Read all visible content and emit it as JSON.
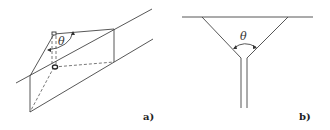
{
  "figure": {
    "panel_a": {
      "label": "a)",
      "angle_symbol": "θ",
      "description": "Oblique view of a prismatic block with a V-shaped notch and dashed internal edges, angle θ marked at top"
    },
    "panel_b": {
      "label": "b)",
      "angle_symbol": "θ",
      "description": "Cross-section of a V-shaped funnel opening into a narrow vertical channel, angle θ marked between the funnel walls"
    },
    "colors": {
      "line": "#444444",
      "background": "#ffffff"
    }
  }
}
